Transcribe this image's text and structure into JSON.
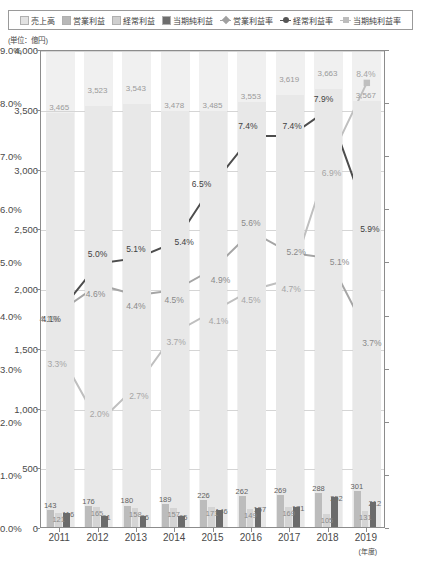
{
  "legend": {
    "items": [
      {
        "label": "売上高",
        "marker": "swatch",
        "icon": "square-swatch-icon",
        "color": "#e2e2e2"
      },
      {
        "label": "営業利益",
        "marker": "swatch",
        "icon": "square-swatch-icon",
        "color": "#b8b8b8"
      },
      {
        "label": "経常利益",
        "marker": "swatch",
        "icon": "square-swatch-icon",
        "color": "#cfcfcf"
      },
      {
        "label": "当期純利益",
        "marker": "swatch",
        "icon": "square-swatch-icon",
        "color": "#6e6e6e"
      },
      {
        "label": "営業利益率",
        "marker": "diamond-line",
        "icon": "diamond-marker-icon",
        "color": "#a0a0a0"
      },
      {
        "label": "経常利益率",
        "marker": "circle-line",
        "icon": "circle-marker-icon",
        "color": "#555555"
      },
      {
        "label": "当期純利益率",
        "marker": "square-line",
        "icon": "square-marker-icon",
        "color": "#bdbdbd"
      }
    ]
  },
  "axis_unit_note": "(単位：億円)",
  "x_unit_note": "(年度)",
  "chart_data": {
    "type": "bar",
    "title": "",
    "xlabel": "(年度)",
    "ylabel": "(単位：億円)",
    "categories": [
      "2011",
      "2012",
      "2013",
      "2014",
      "2015",
      "2016",
      "2017",
      "2018",
      "2019"
    ],
    "ylim": [
      0,
      4000
    ],
    "yticks": [
      "0",
      "500",
      "1,000",
      "1,500",
      "2,000",
      "2,500",
      "3,000",
      "3,500",
      "4,000"
    ],
    "y2lim": [
      0,
      9
    ],
    "y2ticks": [
      "0.0%",
      "1.0%",
      "2.0%",
      "3.0%",
      "4.0%",
      "5.0%",
      "6.0%",
      "7.0%",
      "8.0%",
      "9.0%"
    ],
    "grid": true,
    "legend_position": "top",
    "series": [
      {
        "name": "売上高",
        "kind": "bar",
        "axis": "left",
        "color": "#e8e8e8",
        "values": [
          3465,
          3523,
          3543,
          3478,
          3485,
          3553,
          3619,
          3663,
          3567
        ],
        "labels": [
          "3,465",
          "3,523",
          "3,543",
          "3,478",
          "3,485",
          "3,553",
          "3,619",
          "3,663",
          "3,567"
        ]
      },
      {
        "name": "営業利益",
        "kind": "bar",
        "axis": "left",
        "color": "#bcbcbc",
        "values": [
          143,
          176,
          180,
          189,
          226,
          262,
          269,
          288,
          301
        ],
        "labels": [
          "143",
          "176",
          "180",
          "189",
          "226",
          "262",
          "269",
          "288",
          "301"
        ]
      },
      {
        "name": "経常利益",
        "kind": "bar",
        "axis": "left",
        "color": "#d4d4d4",
        "values": [
          121,
          165,
          158,
          157,
          171,
          149,
          169,
          105,
          131
        ],
        "labels": [
          "121",
          "165",
          "158",
          "157",
          "171",
          "149",
          "169",
          "105",
          "131"
        ]
      },
      {
        "name": "当期純利益",
        "kind": "bar",
        "axis": "left",
        "color": "#6b6b6b",
        "values": [
          116,
          91,
          96,
          95,
          146,
          157,
          171,
          252,
          212
        ],
        "labels": [
          "116",
          "91",
          "96",
          "95",
          "146",
          "157",
          "171",
          "252",
          "212"
        ]
      },
      {
        "name": "営業利益率",
        "kind": "line",
        "axis": "right",
        "color": "#a5a5a5",
        "marker": "diamond",
        "values": [
          4.1,
          4.6,
          4.4,
          4.5,
          4.9,
          5.6,
          5.2,
          5.1,
          3.7
        ],
        "labels": [
          "4.1%",
          "4.6%",
          "4.4%",
          "4.5%",
          "4.9%",
          "5.6%",
          "5.2%",
          "5.1%",
          "3.7%"
        ]
      },
      {
        "name": "経常利益率",
        "kind": "line",
        "axis": "right",
        "color": "#4d4d4d",
        "marker": "circle",
        "values": [
          4.1,
          5.0,
          5.1,
          5.4,
          6.5,
          7.4,
          7.4,
          7.9,
          5.9
        ],
        "labels": [
          "4.1%",
          "5.0%",
          "5.1%",
          "5.4%",
          "6.5%",
          "7.4%",
          "7.4%",
          "7.9%",
          "5.9%"
        ]
      },
      {
        "name": "当期純利益率",
        "kind": "line",
        "axis": "right",
        "color": "#bfbfbf",
        "marker": "square",
        "values": [
          3.3,
          2.0,
          2.7,
          3.7,
          4.1,
          4.5,
          4.7,
          6.9,
          8.4
        ],
        "labels": [
          "3.3%",
          "2.0%",
          "2.7%",
          "3.7%",
          "4.1%",
          "4.5%",
          "4.7%",
          "6.9%",
          "8.4%"
        ]
      }
    ]
  }
}
